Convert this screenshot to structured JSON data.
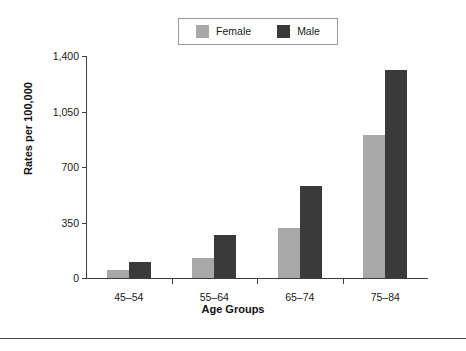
{
  "chart_data": {
    "type": "bar",
    "title": "",
    "subtitle": "",
    "xlabel": "Age Groups",
    "ylabel": "Rates per 100,000",
    "categories": [
      "45–54",
      "55–64",
      "65–74",
      "75–84"
    ],
    "series": [
      {
        "name": "Female",
        "color": "#a8a8a8",
        "values": [
          50,
          125,
          315,
          900
        ]
      },
      {
        "name": "Male",
        "color": "#3a3a3a",
        "values": [
          100,
          270,
          580,
          1310
        ]
      }
    ],
    "ylim": [
      0,
      1400
    ],
    "yticks": [
      0,
      350,
      700,
      1050,
      1400
    ],
    "ytick_labels": [
      "0",
      "350",
      "700",
      "1,050",
      "1,400"
    ],
    "grid": false,
    "legend_position": "top-center"
  },
  "legend": {
    "entries": [
      {
        "label": "Female",
        "color": "#a8a8a8"
      },
      {
        "label": "Male",
        "color": "#3a3a3a"
      }
    ]
  },
  "axes": {
    "x_title": "Age Groups",
    "y_title": "Rates per 100,000"
  }
}
